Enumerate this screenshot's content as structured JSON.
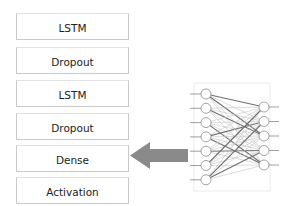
{
  "diagram": {
    "title": "",
    "layers": [
      {
        "label": "LSTM",
        "top": 13
      },
      {
        "label": "Dropout",
        "top": 47
      },
      {
        "label": "LSTM",
        "top": 80
      },
      {
        "label": "Dropout",
        "top": 113
      },
      {
        "label": "Dense",
        "top": 145
      },
      {
        "label": "Activation",
        "top": 177
      }
    ],
    "arrow": {
      "direction": "left",
      "points_to": "Dense",
      "color": "#8a8a8a"
    },
    "network": {
      "input_nodes": 7,
      "output_nodes": 5,
      "connection": "fully-connected",
      "node_color": "#ffffff",
      "edge_color": "#9a9a9a"
    }
  }
}
